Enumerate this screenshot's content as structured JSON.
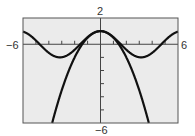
{
  "chart_data": {
    "type": "line",
    "title": "",
    "xlabel": "",
    "ylabel": "",
    "xlim": [
      -6,
      6
    ],
    "ylim": [
      -6,
      2
    ],
    "x_tick_step": 1,
    "y_tick_step": 1,
    "grid": false,
    "legend": null,
    "window_labels": {
      "xmin": "−6",
      "xmax": "6",
      "ymin": "−6",
      "ymax": "2"
    },
    "series": [
      {
        "name": "y = cos x",
        "expr": "cos(x)",
        "points": [
          [
            -6,
            0.96
          ],
          [
            -4.71,
            0
          ],
          [
            -3.14,
            -1
          ],
          [
            -1.57,
            0
          ],
          [
            0,
            1
          ],
          [
            1.57,
            0
          ],
          [
            3.14,
            -1
          ],
          [
            4.71,
            0
          ],
          [
            6,
            0.96
          ]
        ]
      },
      {
        "name": "y = 1 − x²/2",
        "expr": "1 - x^2/2",
        "points": [
          [
            -3.74,
            -6
          ],
          [
            -3,
            -3.5
          ],
          [
            -2,
            -1
          ],
          [
            -1,
            0.5
          ],
          [
            0,
            1
          ],
          [
            1,
            0.5
          ],
          [
            2,
            -1
          ],
          [
            3,
            -3.5
          ],
          [
            3.74,
            -6
          ]
        ]
      }
    ]
  },
  "colors": {
    "background": "#ebebeb",
    "frame": "#555555",
    "curve": "#111111",
    "axis": "#444444"
  }
}
